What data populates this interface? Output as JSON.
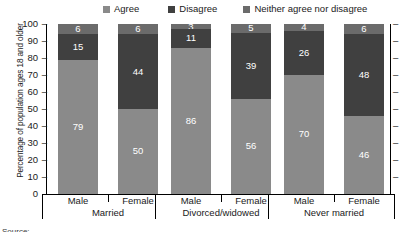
{
  "chart_data": {
    "type": "bar",
    "subtype": "stacked-bar-100",
    "title": "",
    "xlabel": "",
    "ylabel": "Percentage of population ages 18 and older",
    "ylim": [
      0,
      100
    ],
    "ytick_labels": [
      "100",
      "90",
      "80",
      "70",
      "60",
      "50",
      "40",
      "30",
      "20",
      "10",
      "0"
    ],
    "ytick_values": [
      100,
      90,
      80,
      70,
      60,
      50,
      40,
      30,
      20,
      10,
      0
    ],
    "grid": false,
    "legend_position": "top",
    "stack_order_bottom_to_top": [
      "Agree",
      "Disagree",
      "Neither agree nor disagree"
    ],
    "groups": [
      "Married",
      "Divorced/widowed",
      "Never married"
    ],
    "categories": [
      "Married – Male",
      "Married – Female",
      "Divorced/widowed – Male",
      "Divorced/widowed – Female",
      "Never married – Male",
      "Never married – Female"
    ],
    "sub_categories": [
      "Male",
      "Female"
    ],
    "series": [
      {
        "name": "Agree",
        "color": "#8a8a8a",
        "values": [
          79,
          50,
          86,
          56,
          70,
          46
        ]
      },
      {
        "name": "Disagree",
        "color": "#404040",
        "values": [
          15,
          44,
          11,
          39,
          26,
          48
        ]
      },
      {
        "name": "Neither agree nor disagree",
        "color": "#6b6b6b",
        "values": [
          6,
          6,
          3,
          5,
          4,
          6
        ]
      }
    ]
  },
  "legend": {
    "items": [
      {
        "label": "Agree",
        "color": "#8a8a8a"
      },
      {
        "label": "Disagree",
        "color": "#404040"
      },
      {
        "label": "Neither agree nor disagree",
        "color": "#6b6b6b"
      }
    ]
  },
  "axes": {
    "y_title": "Percentage of population ages 18 and older",
    "y_ticks": [
      "100",
      "90",
      "80",
      "70",
      "60",
      "50",
      "40",
      "30",
      "20",
      "10",
      "0"
    ],
    "tick_dash": "–"
  },
  "x_axis": {
    "groups": [
      {
        "label": "Married",
        "sub": [
          "Male",
          "Female"
        ]
      },
      {
        "label": "Divorced/widowed",
        "sub": [
          "Male",
          "Female"
        ]
      },
      {
        "label": "Never married",
        "sub": [
          "Male",
          "Female"
        ]
      }
    ]
  },
  "bars": [
    {
      "group": "Married",
      "sub": "Male",
      "agree": "79",
      "disagree": "15",
      "neither": "6"
    },
    {
      "group": "Married",
      "sub": "Female",
      "agree": "50",
      "disagree": "44",
      "neither": "6"
    },
    {
      "group": "Divorced/widowed",
      "sub": "Male",
      "agree": "86",
      "disagree": "11",
      "neither": "3"
    },
    {
      "group": "Divorced/widowed",
      "sub": "Female",
      "agree": "56",
      "disagree": "39",
      "neither": "5"
    },
    {
      "group": "Never married",
      "sub": "Male",
      "agree": "70",
      "disagree": "26",
      "neither": "4"
    },
    {
      "group": "Never married",
      "sub": "Female",
      "agree": "46",
      "disagree": "48",
      "neither": "6"
    }
  ],
  "footer": {
    "source_note": "Source:"
  }
}
